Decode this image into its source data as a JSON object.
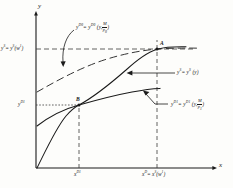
{
  "figure": {
    "type": "economics-diagram",
    "axes": {
      "y_axis_label": "y",
      "x_axis_label": "x"
    },
    "curves": [
      {
        "id": "yD0",
        "style": "long-dashed",
        "label_base": "y",
        "label_sup": "D0",
        "label_eq": "= y",
        "label_args": "(y,",
        "frac_num": "M",
        "frac_den": "p0",
        "note": "upper dashed money-demand curve shifted by M/p0"
      },
      {
        "id": "yS",
        "style": "solid",
        "note": "aggregate supply curve through origin, B and A"
      },
      {
        "id": "yD1",
        "style": "solid",
        "note": "lower solid demand curve through B"
      }
    ],
    "labels": {
      "curve_yD0": {
        "text": "y^D0 = y^D0 (y, M/p0)",
        "base": "y",
        "sup1": "D0",
        "eq": "= y",
        "sup2": "D0",
        "args_open": "(y,",
        "num": "M",
        "den": "p",
        "den_sub": "0",
        "args_close": ")"
      },
      "curve_yS": {
        "text": "y^S = y^S (y)",
        "base": "y",
        "sup1": "S",
        "eq": "= y",
        "sup2": "S",
        "args": "(y)"
      },
      "curve_yD1": {
        "text": "y^D1 = y^D1 (y, M/p1)",
        "base": "y",
        "sup1": "D1",
        "eq": "= y",
        "sup2": "D1",
        "args_open": "(y,",
        "num": "M",
        "den": "p",
        "den_sub": "1",
        "args_close": ")"
      },
      "yaxis_tick_top": {
        "text": "y^S = y^S(w1)",
        "base": "y",
        "sup1": "S",
        "eq": "= y",
        "sup2": "S",
        "args": "(w",
        "args_sup": "1",
        "args_close": ")"
      },
      "yaxis_tick_low": {
        "text": "y^D1",
        "base": "y",
        "sup": "D1"
      },
      "xaxis_tick_left": {
        "text": "x^D1",
        "base": "x",
        "sup": "D1"
      },
      "xaxis_tick_right": {
        "text": "x^D = x^S(w1)",
        "base": "x",
        "sup1": "D",
        "eq": "= x",
        "sup2": "S",
        "args": "(w",
        "args_sup": "1",
        "args_close": ")"
      },
      "point_a": "A",
      "point_b": "B"
    },
    "points": [
      {
        "name": "A",
        "x": 157,
        "y": 49
      },
      {
        "name": "B",
        "x": 79,
        "y": 105
      }
    ],
    "colors": {
      "ink": "#1a1a1a",
      "background": "#fdfdfb",
      "guide": "#4a4a4a"
    }
  }
}
